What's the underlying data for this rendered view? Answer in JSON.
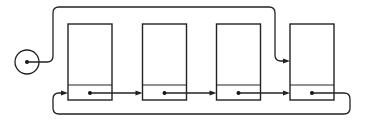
{
  "diagram": {
    "title": "",
    "type": "circular singly linked list with head pointer",
    "head": {
      "label": "",
      "points_to_node": 4
    },
    "nodes": [
      {
        "id": 1,
        "data_label": "",
        "next": 2
      },
      {
        "id": 2,
        "data_label": "",
        "next": 3
      },
      {
        "id": 3,
        "data_label": "",
        "next": 4
      },
      {
        "id": 4,
        "data_label": "",
        "next": 1
      }
    ],
    "colors": {
      "line": "#222222",
      "background": "#ffffff"
    }
  }
}
